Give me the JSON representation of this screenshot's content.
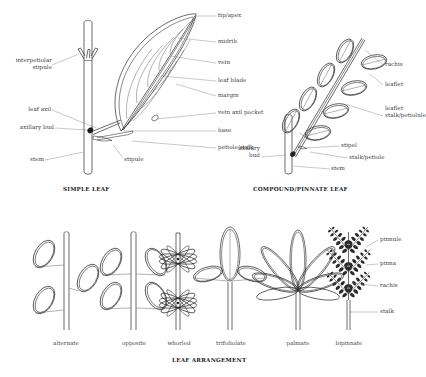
{
  "figure": {
    "line_color": "#2b2b2b",
    "label_color": "#3a3a3a",
    "caption_color": "#1b1b1b",
    "background": "#ffffff"
  },
  "panels": {
    "simple_leaf": {
      "caption": "SIMPLE LEAF",
      "labels_left": [
        {
          "text_line1": "interpetiolar",
          "text_line2": "stipule"
        },
        {
          "text": "leaf axil"
        },
        {
          "text": "axillary bud"
        },
        {
          "text": "stem"
        }
      ],
      "labels_right": [
        {
          "text": "tip/apex"
        },
        {
          "text": "midrib"
        },
        {
          "text": "vein"
        },
        {
          "text": "leaf blade"
        },
        {
          "text": "margin"
        },
        {
          "text": "vein axil pocket"
        },
        {
          "text": "base"
        },
        {
          "text": "petiole/stalk"
        },
        {
          "text": "stipule"
        }
      ]
    },
    "compound_leaf": {
      "caption": "COMPOUND/PINNATE LEAF",
      "labels_right": [
        {
          "text": "rachis"
        },
        {
          "text": "leaflet"
        },
        {
          "text_line1": "leaflet",
          "text_line2": "stalk/petiolule"
        },
        {
          "text": "stipel"
        },
        {
          "text": "stalk/petiole"
        },
        {
          "text": "stem"
        }
      ],
      "labels_left": [
        {
          "text_line1": "axillary",
          "text_line2": "bud"
        }
      ]
    },
    "leaf_arrangement": {
      "caption": "LEAF ARRANGEMENT",
      "types": [
        {
          "name": "alternate"
        },
        {
          "name": "opposite"
        },
        {
          "name": "whorled"
        },
        {
          "name": "trifoliolate"
        },
        {
          "name": "palmate"
        },
        {
          "name": "bipinnate"
        }
      ],
      "bipinnate_labels": [
        {
          "text": "pinnule"
        },
        {
          "text": "pinna"
        },
        {
          "text": "rachis"
        },
        {
          "text": "stalk"
        }
      ]
    }
  }
}
